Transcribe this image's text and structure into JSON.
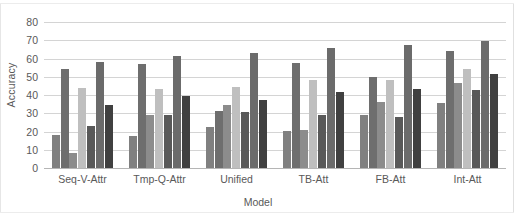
{
  "chart_data": {
    "type": "bar",
    "title": "",
    "xlabel": "Model",
    "ylabel": "Accuracy",
    "ylim": [
      0,
      80
    ],
    "ytick_step": 10,
    "yticks": [
      "0",
      "10",
      "20",
      "30",
      "40",
      "50",
      "60",
      "70",
      "80"
    ],
    "grid": true,
    "legend": "none",
    "categories": [
      "Seq-V-Attr",
      "Tmp-Q-Attr",
      "Unified",
      "TB-Att",
      "FB-Att",
      "Int-Att"
    ],
    "series": [
      {
        "name": "series-1",
        "color": "#808080",
        "values": [
          18,
          17.5,
          22.5,
          20.5,
          29,
          35.5
        ]
      },
      {
        "name": "series-2",
        "color": "#6e6e6e",
        "values": [
          54,
          57,
          31.5,
          57.5,
          50,
          64
        ]
      },
      {
        "name": "series-3",
        "color": "#8c8c8c",
        "values": [
          8,
          29,
          34.5,
          21,
          36,
          46.5
        ]
      },
      {
        "name": "series-4",
        "color": "#bfbfbf",
        "values": [
          44,
          43.5,
          44.5,
          48,
          48,
          54
        ]
      },
      {
        "name": "series-5",
        "color": "#595959",
        "values": [
          23,
          29,
          30.5,
          29,
          28,
          43
        ]
      },
      {
        "name": "series-6",
        "color": "#6b6b6b",
        "values": [
          58,
          61.5,
          63,
          65.5,
          67.5,
          69.5
        ]
      },
      {
        "name": "series-7",
        "color": "#404040",
        "values": [
          34.5,
          39.5,
          37,
          41.5,
          43.5,
          51.5
        ]
      }
    ]
  },
  "axis": {
    "y_title": "Accuracy",
    "x_title": "Model"
  }
}
